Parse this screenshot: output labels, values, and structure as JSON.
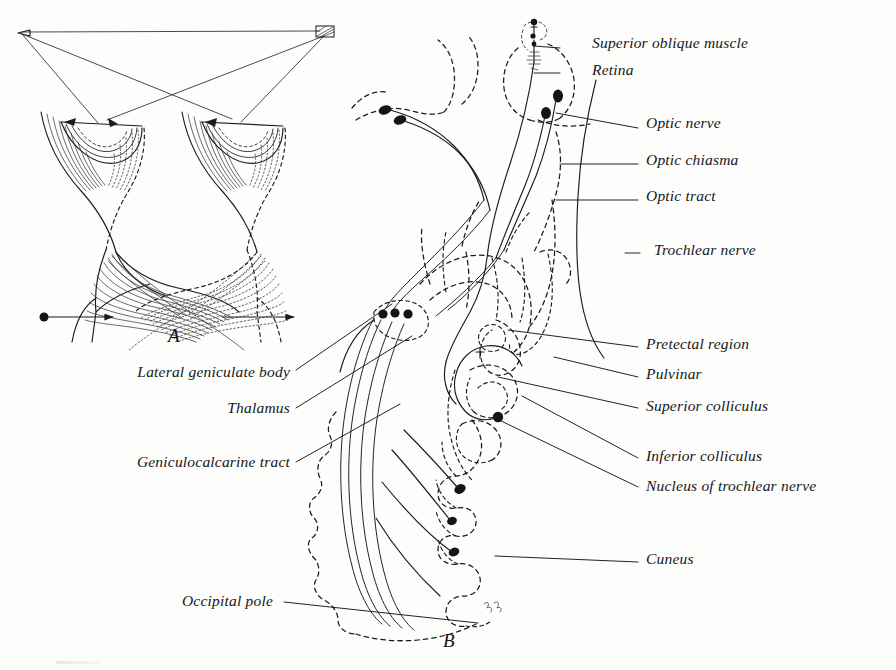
{
  "figure": {
    "panels": [
      {
        "id": "A",
        "letter": "A",
        "x": 168,
        "y": 336,
        "description": "Optic chiasm with crossing and uncrossed retinal fibers from both eyes, fixation arrows"
      },
      {
        "id": "B",
        "letter": "B",
        "x": 443,
        "y": 641,
        "description": "Sagittal/oblique view of brain showing optic nerve, chiasm, tract, lateral geniculate body, geniculocalcarine tract to occipital cortex, and trochlear nerve course"
      }
    ],
    "ink_color": "#16161a",
    "background_color": "#ffffff",
    "labels_right": [
      {
        "id": "superior-oblique-muscle",
        "text": "Superior oblique muscle",
        "x": 592,
        "y": 46,
        "leader": {
          "x1": 560,
          "y1": 48,
          "x2": 534,
          "y2": 46
        }
      },
      {
        "id": "retina",
        "text": "Retina",
        "x": 592,
        "y": 73,
        "leader": {
          "x1": 560,
          "y1": 73,
          "x2": 534,
          "y2": 73
        }
      },
      {
        "id": "optic-nerve",
        "text": "Optic nerve",
        "x": 646,
        "y": 126,
        "leader": {
          "x1": 638,
          "y1": 128,
          "x2": 556,
          "y2": 113
        }
      },
      {
        "id": "optic-chiasma",
        "text": "Optic chiasma",
        "x": 646,
        "y": 163,
        "leader": {
          "x1": 638,
          "y1": 164,
          "x2": 560,
          "y2": 164
        }
      },
      {
        "id": "optic-tract",
        "text": "Optic tract",
        "x": 646,
        "y": 199,
        "leader": {
          "x1": 638,
          "y1": 200,
          "x2": 556,
          "y2": 200
        }
      },
      {
        "id": "trochlear-nerve",
        "text": "Trochlear nerve",
        "x": 654,
        "y": 253,
        "leader": {
          "x1": 640,
          "y1": 253,
          "x2": 625,
          "y2": 253
        }
      },
      {
        "id": "pretectal-region",
        "text": "Pretectal region",
        "x": 646,
        "y": 347,
        "leader": {
          "x1": 638,
          "y1": 347,
          "x2": 508,
          "y2": 330
        }
      },
      {
        "id": "pulvinar",
        "text": "Pulvinar",
        "x": 646,
        "y": 377,
        "leader": {
          "x1": 638,
          "y1": 377,
          "x2": 554,
          "y2": 357
        }
      },
      {
        "id": "superior-colliculus",
        "text": "Superior colliculus",
        "x": 646,
        "y": 409,
        "leader": {
          "x1": 638,
          "y1": 408,
          "x2": 498,
          "y2": 377
        }
      },
      {
        "id": "inferior-colliculus",
        "text": "Inferior colliculus",
        "x": 646,
        "y": 459,
        "leader": {
          "x1": 638,
          "y1": 458,
          "x2": 522,
          "y2": 396
        }
      },
      {
        "id": "nucleus-of-trochlear-nerve",
        "text": "Nucleus of trochlear nerve",
        "x": 646,
        "y": 489,
        "leader": {
          "x1": 638,
          "y1": 487,
          "x2": 497,
          "y2": 419
        }
      },
      {
        "id": "cuneus",
        "text": "Cuneus",
        "x": 646,
        "y": 562,
        "leader": {
          "x1": 638,
          "y1": 562,
          "x2": 495,
          "y2": 556
        }
      }
    ],
    "labels_left": [
      {
        "id": "lateral-geniculate-body",
        "text": "Lateral geniculate body",
        "x": 290,
        "y": 375,
        "leader": {
          "x1": 296,
          "y1": 370,
          "x2": 392,
          "y2": 304
        }
      },
      {
        "id": "thalamus",
        "text": "Thalamus",
        "x": 290,
        "y": 411,
        "leader": {
          "x1": 296,
          "y1": 408,
          "x2": 412,
          "y2": 336
        }
      },
      {
        "id": "geniculocalcarine-tract",
        "text": "Geniculocalcarine tract",
        "x": 290,
        "y": 465,
        "leader": {
          "x1": 296,
          "y1": 462,
          "x2": 400,
          "y2": 404
        }
      },
      {
        "id": "occipital-pole",
        "text": "Occipital pole",
        "x": 273,
        "y": 604,
        "leader": {
          "x1": 284,
          "y1": 602,
          "x2": 478,
          "y2": 623
        }
      }
    ]
  }
}
